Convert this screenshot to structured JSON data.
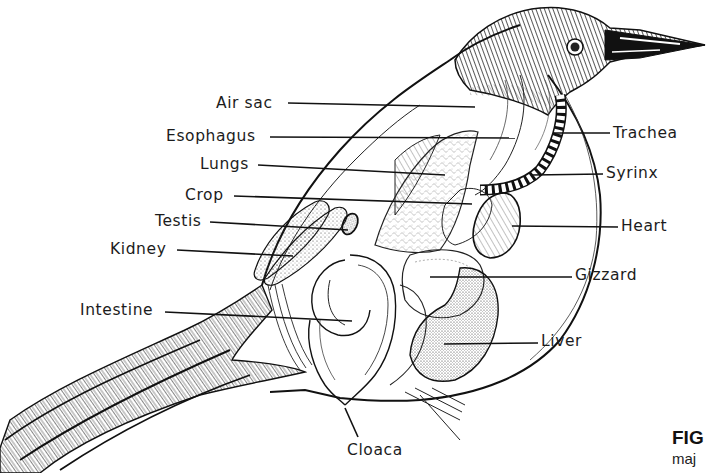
{
  "diagram": {
    "line_color": "#111111",
    "stipple_color": "#555555",
    "background": "#ffffff"
  },
  "labels_left": [
    {
      "text": "Air sac",
      "x": 216,
      "y": 97,
      "line_to": [
        475,
        107
      ]
    },
    {
      "text": "Esophagus",
      "x": 166,
      "y": 129,
      "line_to": [
        515,
        138
      ]
    },
    {
      "text": "Lungs",
      "x": 200,
      "y": 157,
      "line_to": [
        445,
        175
      ]
    },
    {
      "text": "Crop",
      "x": 185,
      "y": 188,
      "line_to": [
        472,
        204
      ]
    },
    {
      "text": "Testis",
      "x": 155,
      "y": 214,
      "line_to": [
        348,
        230
      ]
    },
    {
      "text": "Kidney",
      "x": 110,
      "y": 242,
      "line_to": [
        293,
        256
      ]
    },
    {
      "text": "Intestine",
      "x": 80,
      "y": 302,
      "line_to": [
        352,
        321
      ]
    }
  ],
  "labels_right": [
    {
      "text": "Trachea",
      "x": 612,
      "y": 127,
      "line_from": [
        553,
        133
      ]
    },
    {
      "text": "Syrinx",
      "x": 605,
      "y": 167,
      "line_from": [
        532,
        175
      ]
    },
    {
      "text": "Heart",
      "x": 620,
      "y": 220,
      "line_from": [
        512,
        226
      ]
    },
    {
      "text": "Gizzard",
      "x": 574,
      "y": 266,
      "line_from": [
        430,
        277
      ]
    },
    {
      "text": "Liver",
      "x": 540,
      "y": 333,
      "line_from": [
        444,
        344
      ]
    }
  ],
  "labels_bottom": [
    {
      "text": "Cloaca",
      "x": 347,
      "y": 443,
      "line_from": [
        345,
        408
      ]
    }
  ],
  "caption": {
    "fig_text": "FIG",
    "sub_text": "maj"
  }
}
